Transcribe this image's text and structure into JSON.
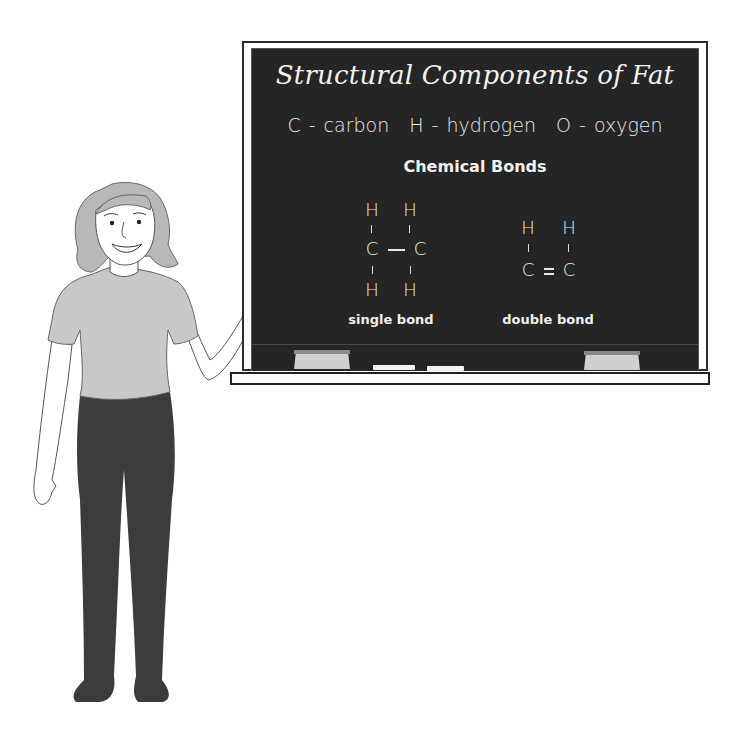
{
  "board": {
    "title": "Structural Components of Fat",
    "legend": [
      {
        "symbol": "C",
        "name": "carbon",
        "label": "C - carbon"
      },
      {
        "symbol": "H",
        "name": "hydrogen",
        "label": "H - hydrogen"
      },
      {
        "symbol": "O",
        "name": "oxygen",
        "label": "O - oxygen"
      }
    ],
    "subtitle": "Chemical Bonds",
    "single_bond": {
      "atoms": {
        "top_left": "H",
        "top_right": "H",
        "left": "C",
        "right": "C",
        "bottom_left": "H",
        "bottom_right": "H"
      },
      "label": "single bond"
    },
    "double_bond": {
      "atoms": {
        "top_left": "H",
        "top_right": "H",
        "left": "C",
        "right": "C"
      },
      "label": "double bond"
    }
  },
  "colors": {
    "board": "#252525",
    "chalk": "#f2f2f2",
    "shirt": "#c8c8c8",
    "hair": "#b8b8b8",
    "pants": "#3c3c3c",
    "outline": "#555555"
  }
}
